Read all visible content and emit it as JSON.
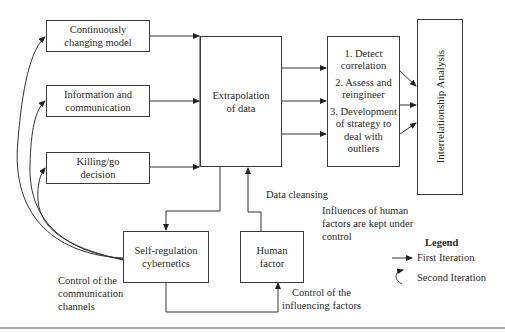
{
  "diagram": {
    "inputs": [
      {
        "id": "continuously-changing-model",
        "label_line1": "Continuously",
        "label_line2": "changing model"
      },
      {
        "id": "information-and-communication",
        "label_line1": "Information and",
        "label_line2": "communication"
      },
      {
        "id": "killing-go-decision",
        "label_line1": "Killing/go",
        "label_line2": "decision"
      }
    ],
    "extrapolation": {
      "label": "Extrapolation of data"
    },
    "steps": [
      {
        "line1": "1. Detect",
        "line2": "correlation"
      },
      {
        "line1": "2. Assess and",
        "line2": "reingineer"
      },
      {
        "line1": "3. Development",
        "line2": "of strategy to",
        "line3": "deal with",
        "line4": "outliers"
      }
    ],
    "interrelationship": {
      "label": "Interrelationship Analysis"
    },
    "self_regulation": {
      "label_line1": "Self-regulation",
      "label_line2": "cybernetics"
    },
    "human_factor": {
      "label_line1": "Human",
      "label_line2": "factor"
    },
    "annotations": {
      "data_cleansing": "Data cleansing",
      "influences_line1": "Influences of human",
      "influences_line2": "factors are kept under",
      "influences_line3": "control",
      "control_comm_line1": "Control of the",
      "control_comm_line2": "communication",
      "control_comm_line3": "channels",
      "control_infl_line1": "Control of the",
      "control_infl_line2": "influencing factors"
    },
    "legend": {
      "title": "Legend",
      "first": "First Iteration",
      "second": "Second Iteration"
    }
  }
}
